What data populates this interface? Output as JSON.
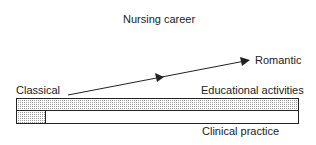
{
  "diagram": {
    "title": "Nursing career",
    "labels": {
      "classical": "Classical",
      "romantic": "Romantic",
      "educational": "Educational activities",
      "clinical": "Clinical practice"
    },
    "colors": {
      "line": "#222222",
      "shade": "#d8d8d8"
    }
  }
}
